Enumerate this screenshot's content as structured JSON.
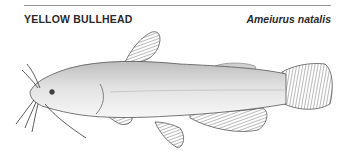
{
  "header": {
    "common_name": "YELLOW BULLHEAD",
    "scientific_name": "Ameiurus natalis"
  },
  "illustration": {
    "subject": "yellow-bullhead-fish",
    "style": "stippled pen illustration",
    "colors": {
      "ink": "#333333",
      "body_shade": "#d9d9d9",
      "body_light": "#f0f0f0",
      "fin": "#9a9a9a"
    }
  }
}
